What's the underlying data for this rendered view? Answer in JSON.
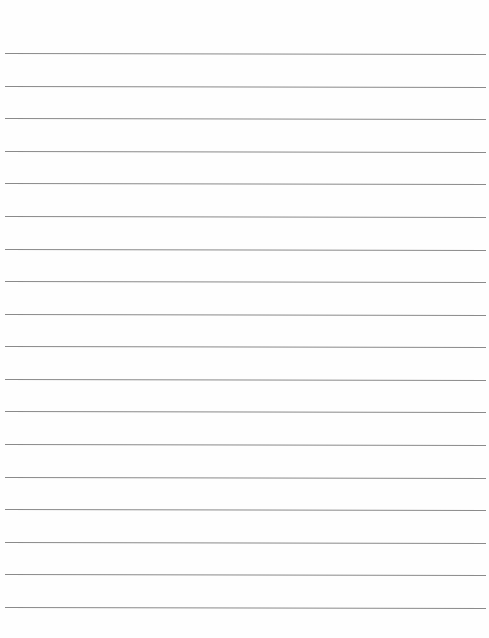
{
  "document": {
    "type": "lined-paper",
    "line_count": 18,
    "first_line_y": 53,
    "last_line_y": 607,
    "line_color": "#8a8a8a",
    "background_color": "#fefefe"
  }
}
